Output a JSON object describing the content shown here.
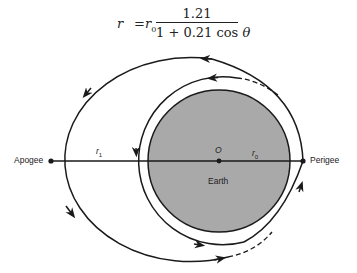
{
  "formula": {
    "lhs": "r",
    "equals": "=",
    "r0_base": "r",
    "r0_sub": "0",
    "numerator": "1.21",
    "denominator_prefix": "1 + 0.21 cos ",
    "denominator_theta": "θ"
  },
  "labels": {
    "apogee": "Apogee",
    "perigee": "Perigee",
    "r1_base": "r",
    "r1_sub": "1",
    "r0_base": "r",
    "r0_sub": "0",
    "center": "O",
    "earth": "Earth"
  },
  "colors": {
    "earth_fill": "#a9a9a9",
    "stroke": "#1a1a1a",
    "background": "#ffffff"
  }
}
